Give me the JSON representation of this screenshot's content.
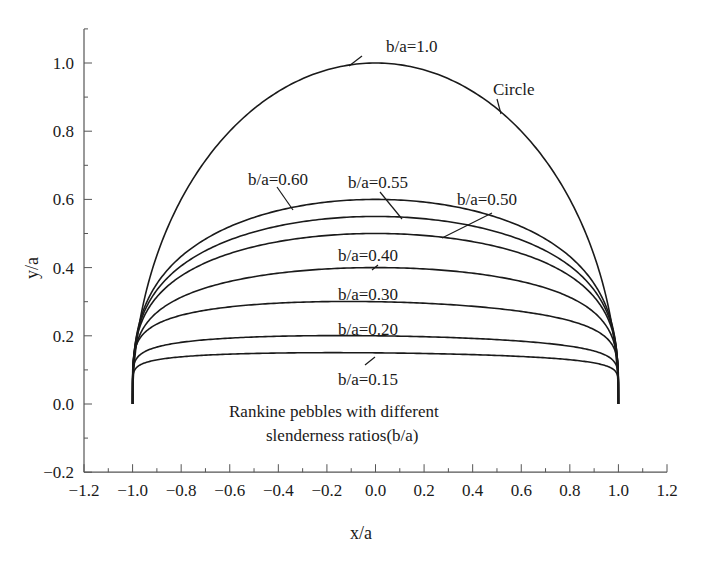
{
  "chart_data": {
    "type": "line",
    "title": "",
    "xlabel": "x/a",
    "ylabel": "y/a",
    "xlim": [
      -1.2,
      1.2
    ],
    "ylim": [
      -0.2,
      1.1
    ],
    "x_ticks": [
      "-1.2",
      "-1.0",
      "-0.8",
      "-0.6",
      "-0.4",
      "-0.2",
      "0.0",
      "0.2",
      "0.4",
      "0.6",
      "0.8",
      "1.0",
      "1.2"
    ],
    "x_tick_values": [
      -1.2,
      -1.0,
      -0.8,
      -0.6,
      -0.4,
      -0.2,
      0.0,
      0.2,
      0.4,
      0.6,
      0.8,
      1.0,
      1.2
    ],
    "y_ticks": [
      "-0.2",
      "0.0",
      "0.2",
      "0.4",
      "0.6",
      "0.8",
      "1.0"
    ],
    "y_tick_values": [
      -0.2,
      0.0,
      0.2,
      0.4,
      0.6,
      0.8,
      1.0
    ],
    "grid": false,
    "legend": "none (curves labelled directly with leader lines)",
    "annotation": "Rankine pebbles with different slenderness ratios(b/a)",
    "annotation_lines": [
      "Rankine pebbles with different",
      "slenderness ratios(b/a)"
    ],
    "series": [
      {
        "name": "b/a=1.0",
        "label": "b/a=1.0",
        "note": "Circle",
        "max_y": 1.0,
        "x": [
          -1.0,
          -0.9,
          -0.8,
          -0.6,
          -0.4,
          -0.2,
          0.0,
          0.2,
          0.4,
          0.6,
          0.8,
          0.9,
          1.0
        ],
        "y": [
          0.0,
          0.44,
          0.6,
          0.8,
          0.92,
          0.98,
          1.0,
          0.98,
          0.92,
          0.8,
          0.6,
          0.44,
          0.0
        ]
      },
      {
        "name": "b/a=0.60",
        "label": "b/a=0.60",
        "max_y": 0.6,
        "x": [
          -1.0,
          -0.9,
          -0.8,
          -0.6,
          -0.4,
          -0.2,
          0.0,
          0.2,
          0.4,
          0.6,
          0.8,
          0.9,
          1.0
        ],
        "y": [
          0.0,
          0.3,
          0.4,
          0.51,
          0.56,
          0.59,
          0.6,
          0.59,
          0.56,
          0.51,
          0.4,
          0.3,
          0.0
        ]
      },
      {
        "name": "b/a=0.55",
        "label": "b/a=0.55",
        "max_y": 0.55,
        "x": [
          -1.0,
          -0.9,
          -0.8,
          -0.6,
          -0.4,
          -0.2,
          0.0,
          0.2,
          0.4,
          0.6,
          0.8,
          0.9,
          1.0
        ],
        "y": [
          0.0,
          0.27,
          0.37,
          0.47,
          0.52,
          0.54,
          0.55,
          0.54,
          0.52,
          0.47,
          0.37,
          0.27,
          0.0
        ]
      },
      {
        "name": "b/a=0.50",
        "label": "b/a=0.50",
        "max_y": 0.5,
        "x": [
          -1.0,
          -0.9,
          -0.8,
          -0.6,
          -0.4,
          -0.2,
          0.0,
          0.2,
          0.4,
          0.6,
          0.8,
          0.9,
          1.0
        ],
        "y": [
          0.0,
          0.26,
          0.35,
          0.44,
          0.48,
          0.495,
          0.5,
          0.495,
          0.48,
          0.44,
          0.35,
          0.26,
          0.0
        ]
      },
      {
        "name": "b/a=0.40",
        "label": "b/a=0.40",
        "max_y": 0.4,
        "x": [
          -1.0,
          -0.9,
          -0.8,
          -0.6,
          -0.4,
          -0.2,
          0.0,
          0.2,
          0.4,
          0.6,
          0.8,
          0.9,
          1.0
        ],
        "y": [
          0.0,
          0.2,
          0.27,
          0.34,
          0.375,
          0.395,
          0.4,
          0.395,
          0.375,
          0.34,
          0.27,
          0.2,
          0.0
        ]
      },
      {
        "name": "b/a=0.30",
        "label": "b/a=0.30",
        "max_y": 0.3,
        "x": [
          -1.0,
          -0.9,
          -0.8,
          -0.6,
          -0.4,
          -0.2,
          0.0,
          0.2,
          0.4,
          0.6,
          0.8,
          0.9,
          1.0
        ],
        "y": [
          0.0,
          0.19,
          0.24,
          0.28,
          0.29,
          0.295,
          0.295,
          0.29,
          0.285,
          0.27,
          0.23,
          0.18,
          0.0
        ]
      },
      {
        "name": "b/a=0.20",
        "label": "b/a=0.20",
        "max_y": 0.2,
        "x": [
          -1.0,
          -0.9,
          -0.8,
          -0.6,
          -0.4,
          -0.2,
          0.0,
          0.2,
          0.4,
          0.6,
          0.8,
          0.9,
          1.0
        ],
        "y": [
          0.0,
          0.14,
          0.17,
          0.19,
          0.195,
          0.195,
          0.195,
          0.195,
          0.19,
          0.185,
          0.17,
          0.14,
          0.0
        ]
      },
      {
        "name": "b/a=0.15",
        "label": "b/a=0.15",
        "max_y": 0.15,
        "x": [
          -1.0,
          -0.9,
          -0.8,
          -0.6,
          -0.4,
          -0.2,
          0.0,
          0.2,
          0.4,
          0.6,
          0.8,
          0.9,
          1.0
        ],
        "y": [
          0.0,
          0.11,
          0.135,
          0.145,
          0.148,
          0.15,
          0.15,
          0.148,
          0.145,
          0.14,
          0.13,
          0.11,
          0.0
        ]
      }
    ],
    "line_color": "#1a1a1a"
  },
  "labels": {
    "ba10": "b/a=1.0",
    "circle": "Circle",
    "ba060": "b/a=0.60",
    "ba055": "b/a=0.55",
    "ba050": "b/a=0.50",
    "ba040": "b/a=0.40",
    "ba030": "b/a=0.30",
    "ba020": "b/a=0.20",
    "ba015": "b/a=0.15",
    "note_line1": "Rankine pebbles with different",
    "note_line2": "slenderness ratios(b/a)",
    "xlabel": "x/a",
    "ylabel": "y/a"
  },
  "x_tick_labels": [
    "−1.2",
    "−1.0",
    "−0.8",
    "−0.6",
    "−0.4",
    "−0.2",
    "0.0",
    "0.2",
    "0.4",
    "0.6",
    "0.8",
    "1.0",
    "1.2"
  ],
  "y_tick_labels": [
    "−0.2",
    "0.0",
    "0.2",
    "0.4",
    "0.6",
    "0.8",
    "1.0"
  ]
}
